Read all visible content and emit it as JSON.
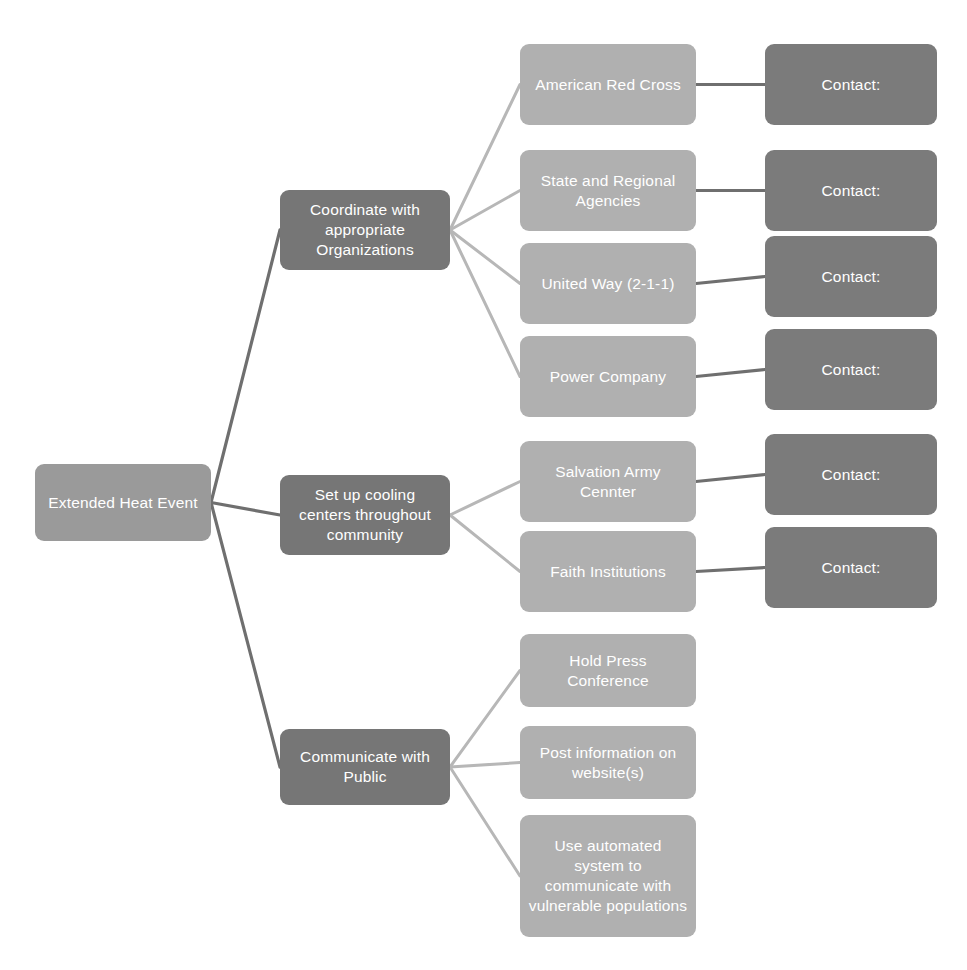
{
  "diagram": {
    "type": "tree-flowchart",
    "canvas": {
      "width": 967,
      "height": 970
    },
    "colors": {
      "root_fill": "#9a9a9a",
      "level2_fill": "#767676",
      "level3_fill": "#b0b0b0",
      "contact_fill": "#7b7b7b",
      "text": "#ffffff",
      "edge_light": "#b7b7b7",
      "edge_dark": "#6f6f6f",
      "background": "#ffffff"
    },
    "root": {
      "id": "root",
      "label": "Extended Heat Event",
      "x": 35,
      "y": 464,
      "w": 176,
      "h": 77
    },
    "branches": [
      {
        "id": "branch-coordinate",
        "label": "Coordinate with appropriate Organizations",
        "x": 280,
        "y": 190,
        "w": 170,
        "h": 80,
        "children": [
          {
            "id": "node-american-red-cross",
            "label": "American Red Cross",
            "x": 520,
            "y": 44,
            "w": 176,
            "h": 81,
            "contact": {
              "id": "contact-american-red-cross",
              "label": "Contact:",
              "x": 765,
              "y": 44,
              "w": 172,
              "h": 81
            }
          },
          {
            "id": "node-state-regional-agencies",
            "label": "State and Regional Agencies",
            "x": 520,
            "y": 150,
            "w": 176,
            "h": 81,
            "contact": {
              "id": "contact-state-regional-agencies",
              "label": "Contact:",
              "x": 765,
              "y": 150,
              "w": 172,
              "h": 81
            }
          },
          {
            "id": "node-united-way",
            "label": "United Way (2-1-1)",
            "x": 520,
            "y": 243,
            "w": 176,
            "h": 81,
            "contact": {
              "id": "contact-united-way",
              "label": "Contact:",
              "x": 765,
              "y": 236,
              "w": 172,
              "h": 81
            }
          },
          {
            "id": "node-power-company",
            "label": "Power Company",
            "x": 520,
            "y": 336,
            "w": 176,
            "h": 81,
            "contact": {
              "id": "contact-power-company",
              "label": "Contact:",
              "x": 765,
              "y": 329,
              "w": 172,
              "h": 81
            }
          }
        ]
      },
      {
        "id": "branch-cooling-centers",
        "label": "Set up cooling centers throughout community",
        "x": 280,
        "y": 475,
        "w": 170,
        "h": 80,
        "children": [
          {
            "id": "node-salvation-army-center",
            "label": "Salvation Army Cennter",
            "x": 520,
            "y": 441,
            "w": 176,
            "h": 81,
            "contact": {
              "id": "contact-salvation-army-center",
              "label": "Contact:",
              "x": 765,
              "y": 434,
              "w": 172,
              "h": 81
            }
          },
          {
            "id": "node-faith-institutions",
            "label": "Faith Institutions",
            "x": 520,
            "y": 531,
            "w": 176,
            "h": 81,
            "contact": {
              "id": "contact-faith-institutions",
              "label": "Contact:",
              "x": 765,
              "y": 527,
              "w": 172,
              "h": 81
            }
          }
        ]
      },
      {
        "id": "branch-communicate-public",
        "label": "Communicate with Public",
        "x": 280,
        "y": 729,
        "w": 170,
        "h": 76,
        "children": [
          {
            "id": "node-hold-press-conference",
            "label": "Hold Press Conference",
            "x": 520,
            "y": 634,
            "w": 176,
            "h": 73,
            "contact": null
          },
          {
            "id": "node-post-information-website",
            "label": "Post information on website(s)",
            "x": 520,
            "y": 726,
            "w": 176,
            "h": 73,
            "contact": null
          },
          {
            "id": "node-automated-system",
            "label": "Use automated system to communicate with vulnerable populations",
            "x": 520,
            "y": 815,
            "w": 176,
            "h": 122,
            "contact": null
          }
        ]
      }
    ]
  }
}
